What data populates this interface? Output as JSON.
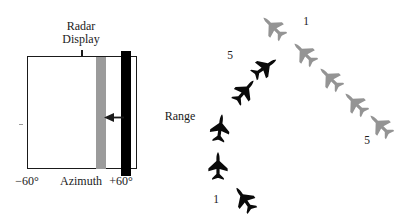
{
  "radar": {
    "title_lines": [
      "Radar",
      "Display"
    ],
    "axis": {
      "left": "−60°",
      "center": "Azimuth",
      "right": "+60°"
    },
    "bars": {
      "gray_color": "#9b9b9b",
      "black_color": "#000000"
    }
  },
  "range_label": "Range",
  "formations": [
    {
      "id": "black-formation",
      "color": "#0a0a0a",
      "planes": [
        {
          "x": 245,
          "y": 200,
          "deg": -35
        },
        {
          "x": 218,
          "y": 167,
          "deg": 0
        },
        {
          "x": 220,
          "y": 129,
          "deg": 8
        },
        {
          "x": 244,
          "y": 92,
          "deg": 40
        },
        {
          "x": 264,
          "y": 68,
          "deg": 55
        }
      ],
      "labels": [
        {
          "text": "1",
          "x": 216,
          "y": 200
        },
        {
          "text": "5",
          "x": 230,
          "y": 56
        }
      ]
    },
    {
      "id": "gray-formation",
      "color": "#949494",
      "planes": [
        {
          "x": 274,
          "y": 28,
          "deg": -45
        },
        {
          "x": 305,
          "y": 54,
          "deg": -45
        },
        {
          "x": 331,
          "y": 79,
          "deg": -45
        },
        {
          "x": 356,
          "y": 104,
          "deg": -45
        },
        {
          "x": 381,
          "y": 126,
          "deg": -45
        }
      ],
      "labels": [
        {
          "text": "1",
          "x": 306,
          "y": 22
        },
        {
          "text": "5",
          "x": 367,
          "y": 141
        }
      ]
    }
  ]
}
